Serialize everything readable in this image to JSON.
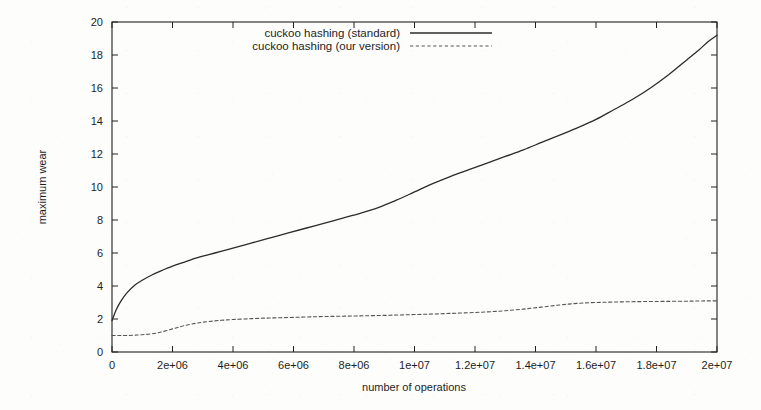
{
  "chart_data": {
    "type": "line",
    "title": "",
    "xlabel": "number of operations",
    "ylabel": "maximum wear",
    "xlim": [
      0,
      20000000
    ],
    "ylim": [
      0,
      20
    ],
    "grid": false,
    "legend_position": "top-center",
    "xtick_labels": [
      "0",
      "2e+06",
      "4e+06",
      "6e+06",
      "8e+06",
      "1e+07",
      "1.2e+07",
      "1.4e+07",
      "1.6e+07",
      "1.8e+07",
      "2e+07"
    ],
    "xtick_values": [
      0,
      2000000,
      4000000,
      6000000,
      8000000,
      10000000,
      12000000,
      14000000,
      16000000,
      18000000,
      20000000
    ],
    "ytick_labels": [
      "0",
      "2",
      "4",
      "6",
      "8",
      "10",
      "12",
      "14",
      "16",
      "18",
      "20"
    ],
    "ytick_values": [
      0,
      2,
      4,
      6,
      8,
      10,
      12,
      14,
      16,
      18,
      20
    ],
    "x": [
      0,
      150000,
      300000,
      500000,
      750000,
      1000000,
      1300000,
      1600000,
      2000000,
      2400000,
      2800000,
      3200000,
      3600000,
      4000000,
      4600000,
      5200000,
      5800000,
      6400000,
      7000000,
      7600000,
      8200000,
      8800000,
      9400000,
      10000000,
      10600000,
      11200000,
      11800000,
      12400000,
      13000000,
      13600000,
      14200000,
      14800000,
      15400000,
      16000000,
      16600000,
      17200000,
      17800000,
      18400000,
      19000000,
      19400000,
      19700000,
      20000000
    ],
    "series": [
      {
        "name": "cuckoo hashing (standard)",
        "style": "solid",
        "color": "#2b2b2b",
        "values": [
          1.9,
          2.6,
          3.1,
          3.6,
          4.05,
          4.35,
          4.65,
          4.9,
          5.2,
          5.45,
          5.7,
          5.9,
          6.1,
          6.3,
          6.6,
          6.9,
          7.2,
          7.5,
          7.8,
          8.1,
          8.4,
          8.75,
          9.2,
          9.7,
          10.2,
          10.65,
          11.05,
          11.45,
          11.85,
          12.25,
          12.7,
          13.15,
          13.6,
          14.1,
          14.7,
          15.3,
          16.0,
          16.8,
          17.7,
          18.3,
          18.8,
          19.2
        ]
      },
      {
        "name": "cuckoo hashing (our version)",
        "style": "dashed",
        "color": "#555555",
        "values": [
          1.0,
          1.0,
          1.0,
          1.0,
          1.02,
          1.05,
          1.1,
          1.2,
          1.4,
          1.6,
          1.75,
          1.85,
          1.92,
          1.97,
          2.02,
          2.06,
          2.09,
          2.12,
          2.15,
          2.17,
          2.19,
          2.21,
          2.24,
          2.27,
          2.3,
          2.34,
          2.38,
          2.43,
          2.5,
          2.6,
          2.72,
          2.85,
          2.95,
          3.0,
          3.03,
          3.05,
          3.06,
          3.07,
          3.08,
          3.09,
          3.1,
          3.1
        ]
      }
    ]
  },
  "legend": {
    "items": [
      {
        "label": "cuckoo hashing (standard)",
        "style": "solid"
      },
      {
        "label": "cuckoo hashing (our version)",
        "style": "dashed"
      }
    ]
  },
  "axes": {
    "x_title": "number of operations",
    "y_title": "maximum wear"
  }
}
